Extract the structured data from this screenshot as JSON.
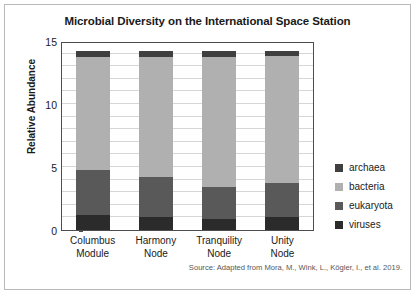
{
  "chart_data": {
    "type": "bar",
    "subtype": "stacked-vertical",
    "title": "Microbial Diversity on the International Space Station",
    "xlabel": "",
    "ylabel": "Relative Abundance",
    "ylim": [
      0,
      15
    ],
    "yticks": [
      0,
      5,
      10,
      15
    ],
    "ytick_labels": [
      "0",
      "5",
      "10",
      "15"
    ],
    "minor_gridlines_every": 1,
    "grid": true,
    "legend_position": "right",
    "categories": [
      "Columbus Module",
      "Harmony Node",
      "Tranquility Node",
      "Unity Node"
    ],
    "category_lines": [
      [
        "Columbus",
        "Module"
      ],
      [
        "Harmony",
        "Node"
      ],
      [
        "Tranquility",
        "Node"
      ],
      [
        "Unity",
        "Node"
      ]
    ],
    "series": [
      {
        "name": "viruses",
        "color": "#2b2b2b",
        "values": [
          1.2,
          1.0,
          0.9,
          1.0
        ]
      },
      {
        "name": "eukaryota",
        "color": "#595959",
        "values": [
          3.6,
          3.2,
          2.5,
          2.7
        ]
      },
      {
        "name": "bacteria",
        "color": "#b0b0b0",
        "values": [
          8.9,
          9.5,
          10.3,
          10.1
        ]
      },
      {
        "name": "archaea",
        "color": "#3f3f3f",
        "values": [
          0.5,
          0.5,
          0.5,
          0.4
        ]
      }
    ],
    "stack_order_bottom_to_top": [
      "viruses",
      "eukaryota",
      "bacteria",
      "archaea"
    ],
    "totals": [
      14.2,
      14.2,
      14.2,
      14.2
    ],
    "annotations": [
      "Source: Adapted from Mora, M., Wink, L., Kögler, I., et al. 2019."
    ]
  },
  "legend": {
    "items": [
      {
        "label": "archaea",
        "color": "#3f3f3f"
      },
      {
        "label": "bacteria",
        "color": "#b0b0b0"
      },
      {
        "label": "eukaryota",
        "color": "#595959"
      },
      {
        "label": "viruses",
        "color": "#2b2b2b"
      }
    ]
  },
  "source": {
    "text": "Source: Adapted from Mora, M., Wink, L., Kögler, I., et al. 2019."
  }
}
